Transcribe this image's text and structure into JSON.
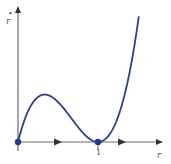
{
  "chart_data": {
    "type": "line",
    "title": "",
    "xlabel": "r",
    "ylabel": "ṙ",
    "ylabel_base": "r",
    "ylabel_dot": "•",
    "x_ticks": [
      {
        "value": 0,
        "label": ""
      },
      {
        "value": 1,
        "label": "1"
      }
    ],
    "xlim": [
      0,
      1.65
    ],
    "ylim": [
      -0.02,
      0.4
    ],
    "grid": false,
    "series": [
      {
        "name": "ṙ = f(r)",
        "color": "#2e3f8f",
        "function": "r*(1-r)^2",
        "x_range": [
          0,
          1.51
        ]
      }
    ],
    "fixed_points": [
      {
        "r": 0,
        "color": "#1f3a93"
      },
      {
        "r": 1,
        "color": "#1f3a93"
      }
    ],
    "flow_arrows": [
      {
        "r": 0.5,
        "direction": "right"
      },
      {
        "r": 1.3,
        "direction": "right"
      }
    ]
  }
}
